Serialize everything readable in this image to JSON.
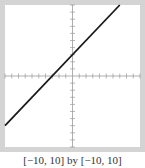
{
  "chart_data": {
    "type": "line",
    "title": "",
    "xlabel": "",
    "ylabel": "",
    "xlim": [
      -10,
      10
    ],
    "ylim": [
      -10,
      10
    ],
    "grid": false,
    "legend": null,
    "axes_style": "calculator-window",
    "x_tick_step": 1,
    "y_tick_step": 1,
    "series": [
      {
        "name": "y = x + 3",
        "equation": "y = x + 3",
        "slope": 1,
        "intercept": 3,
        "x": [
          -10,
          7
        ],
        "y": [
          -7,
          10
        ],
        "color": "#1a1a1a"
      }
    ],
    "caption": "[−10, 10] by [−10, 10]"
  },
  "window": {
    "caption": "[−10, 10] by [−10, 10]"
  },
  "colors": {
    "frame": "#d4d4d4",
    "axis": "#9a9a9a",
    "tick": "#9a9a9a",
    "line": "#1a1a1a",
    "background": "#ffffff"
  }
}
